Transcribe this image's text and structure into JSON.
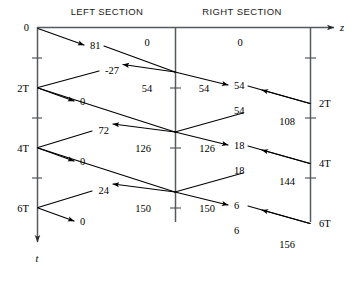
{
  "figure": {
    "type": "bounce-lattice-diagram",
    "headers": {
      "left": "LEFT SECTION",
      "right": "RIGHT SECTION"
    },
    "axes": {
      "horizontal_label": "z",
      "vertical_label": "t",
      "time_labels_left": [
        "0",
        "2T",
        "4T",
        "6T"
      ],
      "time_labels_right": [
        "2T",
        "4T",
        "6T"
      ]
    },
    "left_section_values": {
      "wave_81": "81",
      "wave_neg27": "-27",
      "wave_72": "72",
      "wave_24": "24",
      "terminal_0_a": "0",
      "terminal_0_b": "0",
      "terminal_0_c": "0",
      "cell_0": "0",
      "cell_54": "54",
      "cell_126": "126",
      "cell_150": "150"
    },
    "right_section_values": {
      "cell_0": "0",
      "cell_54": "54",
      "cell_126": "126",
      "cell_150": "150",
      "wave_54_down": "54",
      "wave_54_up": "54",
      "wave_18_down": "18",
      "wave_18_up": "18",
      "wave_6_down": "6",
      "wave_6_up": "6",
      "load_108": "108",
      "load_144": "144",
      "load_156": "156"
    },
    "colors": {
      "axis": "#555a5e",
      "ray": "#000000",
      "text": "#000000",
      "header_text": "#1a1a1a",
      "background": "#ffffff"
    }
  }
}
